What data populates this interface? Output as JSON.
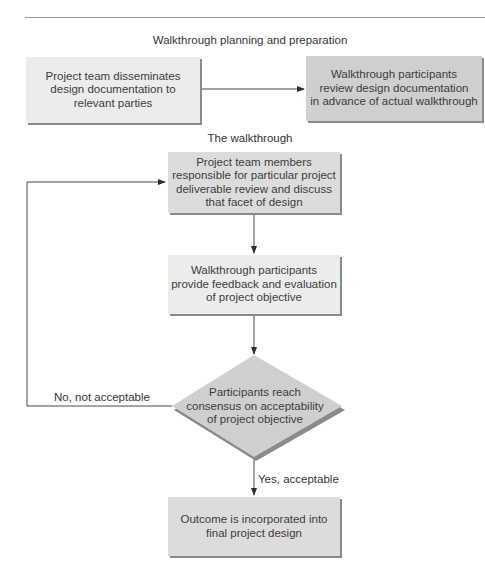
{
  "colors": {
    "box_light": "#ececec",
    "box_mid": "#dcdcdc",
    "box_dark": "#cfcfcf",
    "shadow": "#8a8a8a",
    "line": "#4a4a4a"
  },
  "sections": {
    "planning": "Walkthrough planning and preparation",
    "walkthrough": "The walkthrough"
  },
  "nodes": {
    "disseminate": "Project team disseminates\ndesign documentation to\nrelevant parties",
    "review_docs": "Walkthrough participants\nreview design documentation\nin advance of actual walkthrough",
    "team_discuss": "Project team members\nresponsible for particular project\ndeliverable review and discuss\nthat facet of design",
    "feedback": "Walkthrough participants\nprovide feedback and evaluation\nof project objective",
    "consensus": "Participants reach\nconsensus on acceptability\nof project objective",
    "outcome": "Outcome is incorporated into\nfinal project design"
  },
  "edges": {
    "no_label": "No, not acceptable",
    "yes_label": "Yes, acceptable"
  }
}
